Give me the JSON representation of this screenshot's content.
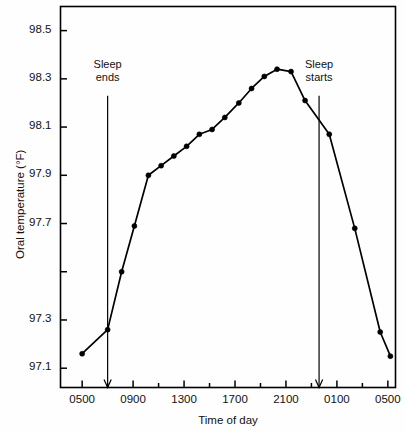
{
  "chart_data": {
    "type": "line",
    "title": "",
    "xlabel": "Time of day",
    "ylabel": "Oral temperature (°F)",
    "ylim": [
      97.02,
      98.6
    ],
    "xlim": [
      3.3,
      29.6
    ],
    "grid": false,
    "legend": "none",
    "y_ticks": [
      {
        "value": 98.5,
        "label": "98.5"
      },
      {
        "value": 98.3,
        "label": "98.3"
      },
      {
        "value": 98.1,
        "label": "98.1"
      },
      {
        "value": 97.9,
        "label": "97.9"
      },
      {
        "value": 97.7,
        "label": "97.7"
      },
      {
        "value": 97.5,
        "label": ""
      },
      {
        "value": 97.3,
        "label": "97.3"
      },
      {
        "value": 97.1,
        "label": "97.1"
      }
    ],
    "x_ticks": [
      {
        "value": 5,
        "label": "0500"
      },
      {
        "value": 7,
        "label": ""
      },
      {
        "value": 9,
        "label": "0900"
      },
      {
        "value": 11,
        "label": ""
      },
      {
        "value": 13,
        "label": "1300"
      },
      {
        "value": 15,
        "label": ""
      },
      {
        "value": 17,
        "label": "1700"
      },
      {
        "value": 19,
        "label": ""
      },
      {
        "value": 21,
        "label": "2100"
      },
      {
        "value": 23,
        "label": ""
      },
      {
        "value": 25,
        "label": "0100"
      },
      {
        "value": 27,
        "label": ""
      },
      {
        "value": 29,
        "label": "0500"
      }
    ],
    "series": [
      {
        "name": "Oral temperature",
        "marker": "filled-circle",
        "x": [
          5.0,
          7.0,
          8.1,
          9.1,
          10.2,
          11.2,
          12.2,
          13.2,
          14.2,
          15.2,
          16.2,
          17.3,
          18.3,
          19.3,
          20.3,
          21.4,
          22.5,
          24.4,
          26.4,
          28.4,
          29.2
        ],
        "values": [
          97.16,
          97.26,
          97.5,
          97.69,
          97.9,
          97.94,
          97.98,
          98.02,
          98.07,
          98.09,
          98.14,
          98.2,
          98.26,
          98.31,
          98.34,
          98.33,
          98.21,
          98.07,
          97.68,
          97.25,
          97.15
        ]
      }
    ],
    "annotations": [
      {
        "id": "sleep-ends",
        "text_line1": "Sleep",
        "text_line2": "ends",
        "x": 7.0,
        "arrow_from_y": 98.23,
        "arrow_to_y": 97.02
      },
      {
        "id": "sleep-starts",
        "text_line1": "Sleep",
        "text_line2": "starts",
        "x": 23.6,
        "arrow_from_y": 98.23,
        "arrow_to_y": 97.02
      }
    ],
    "colors": {
      "line": "#000000",
      "marker": "#000000",
      "axis": "#000000",
      "text": "#111111",
      "background": "#fefefe"
    }
  }
}
